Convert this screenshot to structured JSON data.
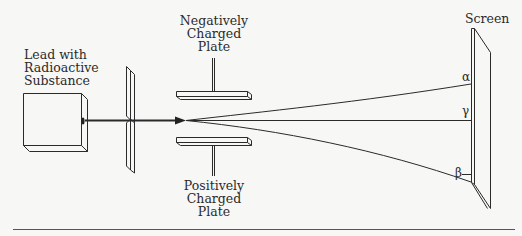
{
  "diagram": {
    "labels": {
      "source": [
        "Lead with",
        "Radioactive",
        "Substance"
      ],
      "negative_plate": [
        "Negatively",
        "Charged",
        "Plate"
      ],
      "positive_plate": [
        "Positively",
        "Charged",
        "Plate"
      ],
      "screen": "Screen"
    },
    "rays": {
      "alpha": "α",
      "gamma": "γ",
      "beta": "β"
    },
    "colors": {
      "line": "#2a2a2a",
      "background": "#f7f7f5",
      "rule": "#555555"
    }
  }
}
